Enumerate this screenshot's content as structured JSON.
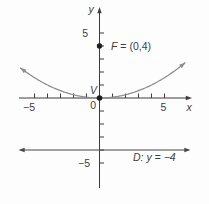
{
  "figure": {
    "colors": {
      "axis": "#3d3d3d",
      "curve": "#8e8e8e",
      "directrix": "#474747",
      "dot": "#1e1e1e",
      "text": "#3d3d3d",
      "background": "#fdfdfd"
    },
    "labels": {
      "y_axis": "y",
      "x_axis": "x",
      "origin": "0",
      "y_tick_pos": "5",
      "y_tick_neg": "−5",
      "x_tick_pos": "5",
      "x_tick_neg": "−5",
      "vertex": "V",
      "focus_var": "F",
      "focus_rest": " = (0,4)",
      "directrix_var": "D",
      "directrix_rest": ": y = −4"
    }
  },
  "chart_data": {
    "type": "line",
    "title": "",
    "xlabel": "x",
    "ylabel": "y",
    "xlim": [
      -6.5,
      7
    ],
    "ylim": [
      -7.5,
      7
    ],
    "grid": false,
    "xticks": [
      -5,
      -4,
      -3,
      -2,
      -1,
      1,
      2,
      3,
      4,
      5
    ],
    "yticks": [
      -5,
      -4,
      -3,
      -2,
      -1,
      1,
      2,
      3,
      4,
      5
    ],
    "equation": "y = x^2/16",
    "curve": {
      "a": 0.0625,
      "x_min": -6.1,
      "x_max": 6.6
    },
    "focus": [
      0,
      4
    ],
    "vertex": [
      0,
      0
    ],
    "directrix_y": -4,
    "x": [
      -6,
      -4,
      -2,
      0,
      2,
      4,
      6
    ],
    "series": [
      {
        "name": "parabola y = x²/16",
        "values": [
          2.25,
          1,
          0.25,
          0,
          0.25,
          1,
          2.25
        ]
      }
    ],
    "annotations": [
      "F = (0,4)",
      "V",
      "D: y = −4",
      "0"
    ]
  }
}
